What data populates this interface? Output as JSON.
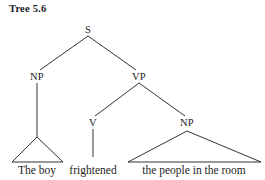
{
  "figure": {
    "title": "Tree 5.6",
    "background_color": "#ffffff",
    "ink_color": "#1c1c1c"
  },
  "tree": {
    "type": "phrase-structure-tree",
    "nodes": [
      {
        "id": "S",
        "label": "S",
        "x": 88,
        "y": 31
      },
      {
        "id": "NP1",
        "label": "NP",
        "x": 37,
        "y": 78
      },
      {
        "id": "VP",
        "label": "VP",
        "x": 139,
        "y": 78
      },
      {
        "id": "V",
        "label": "V",
        "x": 93,
        "y": 124
      },
      {
        "id": "NP2",
        "label": "NP",
        "x": 187,
        "y": 124
      }
    ],
    "edges": [
      {
        "from": "S",
        "to": "NP1"
      },
      {
        "from": "S",
        "to": "VP"
      },
      {
        "from": "VP",
        "to": "V"
      },
      {
        "from": "VP",
        "to": "NP2"
      },
      {
        "from": "NP1",
        "to": "triangle-left"
      },
      {
        "from": "V",
        "to": "frightened"
      }
    ],
    "triangles": [
      {
        "id": "triangle-left",
        "apex_x": 37,
        "apex_y": 137,
        "left_x": 12,
        "right_x": 63,
        "base_y": 162
      },
      {
        "id": "triangle-right",
        "apex_x": 187,
        "apex_y": 131,
        "left_x": 128,
        "right_x": 261,
        "base_y": 162
      }
    ],
    "terminals": [
      {
        "id": "terminal-np1",
        "text": "The boy",
        "x": 37,
        "y": 164
      },
      {
        "id": "terminal-v",
        "text": "frightened",
        "x": 93,
        "y": 164
      },
      {
        "id": "terminal-np2",
        "text": "the people in the room",
        "x": 194,
        "y": 164
      }
    ]
  }
}
